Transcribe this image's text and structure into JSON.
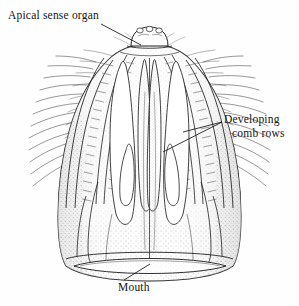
{
  "figure": {
    "view": "oral-aboral whole mount",
    "style": "pen-and-ink stipple line drawing",
    "background_color": "#fefefe",
    "ink_color": "#1a1a1a",
    "stipple_color": "#9a9a9a"
  },
  "labels": {
    "apical": {
      "text": "Apical sense organ",
      "leader": "diagonal line from text down-right to apex dome"
    },
    "developing": {
      "line1": "Developing",
      "line2": "comb rows",
      "leader": "two lines converging right at a point, pointing left to two comb rows"
    },
    "mouth": {
      "text": "Mouth",
      "leader": "short diagonal line up-right into mouth slit"
    }
  },
  "caption": {
    "clipped_text": ""
  },
  "anatomy": {
    "apical_sense_organ": "small domed statocyst at aboral pole",
    "comb_rows": "four visible ciliated bands bearing transverse comb plates with long cilia",
    "meridional_canals": "paired elongated internal canal loops descending from apex",
    "pharynx": "central vertical cavity",
    "mouth": "transverse elliptical opening at oral end"
  }
}
